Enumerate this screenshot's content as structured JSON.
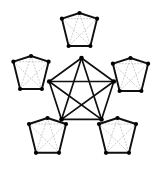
{
  "figure": {
    "background_color": "#ffffff",
    "width": 163,
    "height": 174
  },
  "style": {
    "edge_color": "#101010",
    "vertex_color": "#000000",
    "inner_diagonal_color": "#b8b8b8",
    "outer_edge_width": 1.9,
    "central_edge_width": 1.7,
    "inner_diagonal_width": 0.7,
    "vertex_radius": 2.1,
    "central_vertex_radius": 2.3,
    "inner_diagonal_dash": "1.1 2.0"
  },
  "central_graph": {
    "name": "central-k5",
    "label": "K5",
    "vertex_count": 5,
    "edge_count": 10,
    "radius": 34,
    "center": {
      "x": 81.5,
      "y": 92
    },
    "rotation_deg": -90,
    "vertices": [
      {
        "id": "c0",
        "x": 81.5,
        "y": 58.0
      },
      {
        "id": "c1",
        "x": 113.8,
        "y": 81.5
      },
      {
        "id": "c2",
        "x": 101.5,
        "y": 119.4
      },
      {
        "id": "c3",
        "x": 61.5,
        "y": 119.4
      },
      {
        "id": "c4",
        "x": 49.2,
        "y": 81.5
      }
    ],
    "edges": [
      [
        "c0",
        "c1"
      ],
      [
        "c1",
        "c2"
      ],
      [
        "c2",
        "c3"
      ],
      [
        "c3",
        "c4"
      ],
      [
        "c4",
        "c0"
      ],
      [
        "c0",
        "c2"
      ],
      [
        "c0",
        "c3"
      ],
      [
        "c1",
        "c3"
      ],
      [
        "c1",
        "c4"
      ],
      [
        "c2",
        "c4"
      ]
    ]
  },
  "outer_pentagons": [
    {
      "id": "pentagon-top",
      "position": "top",
      "center": {
        "x": 79.5,
        "y": 31.5
      },
      "radius": 18.5,
      "rotation_deg": -90,
      "vertices": [
        {
          "id": "t0",
          "x": 79.5,
          "y": 13.0
        },
        {
          "id": "t1",
          "x": 97.1,
          "y": 18.7
        },
        {
          "id": "t2",
          "x": 90.4,
          "y": 46.0
        },
        {
          "id": "t3",
          "x": 68.6,
          "y": 46.0
        },
        {
          "id": "t4",
          "x": 61.9,
          "y": 18.7
        }
      ]
    },
    {
      "id": "pentagon-left",
      "position": "left",
      "center": {
        "x": 31.0,
        "y": 74.5
      },
      "radius": 18.5,
      "rotation_deg": -90,
      "vertices": [
        {
          "id": "l0",
          "x": 31.0,
          "y": 56.0
        },
        {
          "id": "l1",
          "x": 48.6,
          "y": 61.7
        },
        {
          "id": "l2",
          "x": 41.9,
          "y": 89.0
        },
        {
          "id": "l3",
          "x": 20.1,
          "y": 89.0
        },
        {
          "id": "l4",
          "x": 13.4,
          "y": 61.7
        }
      ]
    },
    {
      "id": "pentagon-right",
      "position": "right",
      "center": {
        "x": 130.5,
        "y": 76.5
      },
      "radius": 18.5,
      "rotation_deg": -90,
      "vertices": [
        {
          "id": "r0",
          "x": 130.5,
          "y": 58.0
        },
        {
          "id": "r1",
          "x": 148.1,
          "y": 63.7
        },
        {
          "id": "r2",
          "x": 141.4,
          "y": 91.0
        },
        {
          "id": "r3",
          "x": 119.6,
          "y": 91.0
        },
        {
          "id": "r4",
          "x": 112.9,
          "y": 63.7
        }
      ]
    },
    {
      "id": "pentagon-bottom-left",
      "position": "bottom-left",
      "center": {
        "x": 47.5,
        "y": 137.5
      },
      "radius": 19.5,
      "rotation_deg": -90,
      "vertices": [
        {
          "id": "bl0",
          "x": 47.5,
          "y": 118.0
        },
        {
          "id": "bl1",
          "x": 66.0,
          "y": 124.0
        },
        {
          "id": "bl2",
          "x": 59.0,
          "y": 152.8
        },
        {
          "id": "bl3",
          "x": 36.0,
          "y": 152.8
        },
        {
          "id": "bl4",
          "x": 29.0,
          "y": 124.0
        }
      ]
    },
    {
      "id": "pentagon-bottom-right",
      "position": "bottom-right",
      "center": {
        "x": 117.5,
        "y": 137.5
      },
      "radius": 19.5,
      "rotation_deg": -90,
      "vertices": [
        {
          "id": "br0",
          "x": 117.5,
          "y": 118.0
        },
        {
          "id": "br1",
          "x": 136.0,
          "y": 124.0
        },
        {
          "id": "br2",
          "x": 129.0,
          "y": 152.8
        },
        {
          "id": "br3",
          "x": 106.0,
          "y": 152.8
        },
        {
          "id": "br4",
          "x": 99.0,
          "y": 124.0
        }
      ]
    }
  ],
  "outer_pentagon_edges": [
    [
      0,
      1
    ],
    [
      1,
      2
    ],
    [
      2,
      3
    ],
    [
      3,
      4
    ],
    [
      4,
      0
    ]
  ],
  "outer_pentagon_inner_diagonals": [
    [
      0,
      2
    ],
    [
      1,
      3
    ],
    [
      2,
      4
    ],
    [
      3,
      0
    ],
    [
      4,
      1
    ]
  ]
}
